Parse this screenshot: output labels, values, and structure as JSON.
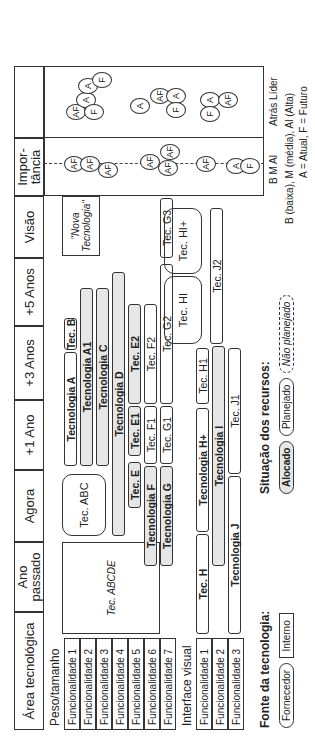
{
  "headers": {
    "area": "Área tecnológica",
    "ano_passado": "Ano passado",
    "agora": "Agora",
    "mais1": "+1 Ano",
    "mais3": "+3 Anos",
    "mais5": "+5 Anos",
    "visao": "Visão",
    "importancia": "Impor- tância"
  },
  "groups": [
    {
      "title": "Peso/tamanho",
      "items": [
        "Funcionalidade 1",
        "Funcionalidade 2",
        "Funcionalidade 3",
        "Funcionalidade 4",
        "Funcionalidade 5",
        "Funcionalidade 6",
        "Funcionalidade 7"
      ]
    },
    {
      "title": "Interface visual",
      "items": [
        "Funcionalidade 1",
        "Funcionalidade 2",
        "Funcionalidade 3"
      ]
    }
  ],
  "boxes": {
    "abcde": "Tec. ABCDE",
    "abc": "Tec. ABC",
    "nova": "\"Nova Tecnologia\"",
    "hi": "Tec. HI",
    "hiplus": "Tec. HI+"
  },
  "bars": {
    "a": "Tecnologia A",
    "b": "Tec. B",
    "a1": "Tecnologia A1",
    "c": "Tecnologia C",
    "d": "Tecnologia D",
    "e": "Tec. E",
    "e1": "Tec. E1",
    "e2": "Tec. E2",
    "f": "Tecnologia F",
    "f1": "Tec. F1",
    "f2": "Tec. F2",
    "g": "Tecnologia G",
    "g1": "Tec. G1",
    "g2": "Tec. G2",
    "g3": "Tec. G3",
    "h": "Tec. H",
    "hplus": "Tecnologia H+",
    "h1": "Tec. H1",
    "i": "Tecnologia I",
    "j": "Tecnologia J",
    "j1": "Tec. J1",
    "j2": "Tec. J2"
  },
  "legend": {
    "fonte_title": "Fonte da tecnologia:",
    "fornecedor": "Fornecedor",
    "interno": "Interno",
    "situacao_title": "Situação dos recursos:",
    "alocado": "Alocado",
    "planejado": "Planejado",
    "nao_planejado": "Não planejado",
    "scale_imp": "B  M  Al",
    "scale_pos": "Atrás  Líder",
    "note1": "B (baixa), M (média), Al (Alta)",
    "note2": "A = Atual, F = Futuro"
  }
}
